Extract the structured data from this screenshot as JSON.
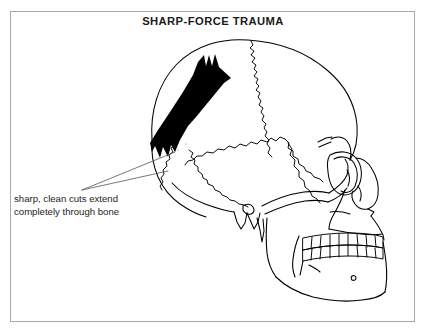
{
  "figure": {
    "title": "SHARP-FORCE TRAUMA",
    "caption_lines": [
      "sharp, clean cuts extend",
      "completely through bone"
    ],
    "caption_full": "sharp, clean cuts extend completely through bone",
    "background_color": "#ffffff",
    "frame_color": "#a8a8a8",
    "ink_color": "#000000",
    "text_color": "#1a1a1a",
    "wound_fill": "#000000",
    "leader_line_color": "#555555"
  },
  "illustration": {
    "subject": "human-skull-lateral-view",
    "anatomy_labels": [
      "cranial-vault",
      "coronal-suture",
      "parietal-bone",
      "temporal-bone",
      "occipital-bone",
      "orbit",
      "nasal-aperture",
      "zygomatic-arch",
      "maxilla",
      "mandible",
      "upper-dentition",
      "lower-dentition",
      "mastoid-process",
      "styloid-process"
    ],
    "trauma": {
      "type": "sharp-force-defect",
      "description": "elongated diagonal cut defect with forked terminal prongs",
      "orientation": "superior-anterior to inferior-posterior"
    }
  }
}
